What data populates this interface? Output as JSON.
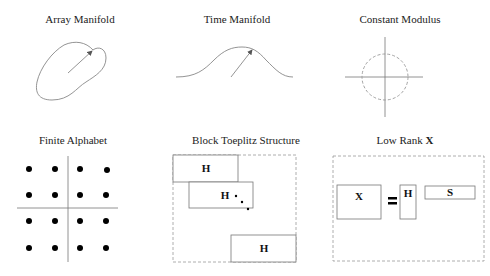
{
  "panels": [
    {
      "id": "array-manifold",
      "title": "Array Manifold"
    },
    {
      "id": "time-manifold",
      "title": "Time Manifold"
    },
    {
      "id": "constant-modulus",
      "title": "Constant Modulus"
    },
    {
      "id": "finite-alphabet",
      "title": "Finite Alphabet"
    },
    {
      "id": "block-toeplitz",
      "title": "Block Toeplitz Structure",
      "blocks": [
        "H",
        "H",
        "H"
      ]
    },
    {
      "id": "low-rank",
      "title_prefix": "Low Rank ",
      "title_bold": "X",
      "matrices": {
        "x": "X",
        "equals": "=",
        "h": "H",
        "s": "S"
      }
    }
  ],
  "colors": {
    "stroke": "#777777",
    "dashed": "#999999",
    "dot": "#000000",
    "text": "#222222"
  }
}
